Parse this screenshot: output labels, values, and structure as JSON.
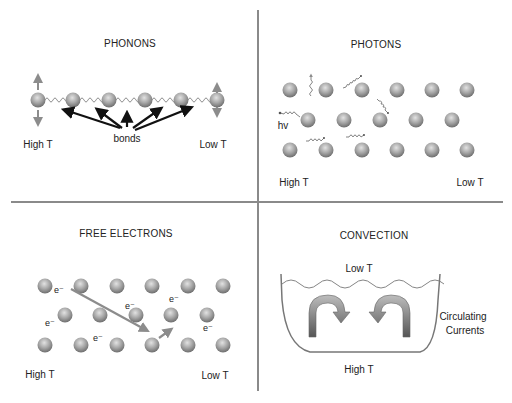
{
  "panels": {
    "phonons": {
      "title": "PHONONS",
      "bonds_label": "bonds",
      "hot_label": "High T",
      "cold_label": "Low T",
      "atoms_x": [
        38,
        73,
        109,
        145,
        181,
        217
      ],
      "atoms_y": 100
    },
    "photons": {
      "title": "PHOTONS",
      "photon_label": "hv",
      "hot_label": "High T",
      "cold_label": "Low T"
    },
    "free_electrons": {
      "title": "FREE ELECTRONS",
      "electron_label": "e⁻",
      "hot_label": "High T",
      "cold_label": "Low T"
    },
    "convection": {
      "title": "CONVECTION",
      "top_label": "Low T",
      "bottom_label": "High T",
      "side_label_line1": "Circulating",
      "side_label_line2": "Currents"
    }
  },
  "colors": {
    "divider": "#8a8a8a",
    "atom_light": "#d4d4d4",
    "atom_dark": "#7d7d7d",
    "arrow_gray": "#8c8c8c",
    "arrow_black": "#111111"
  }
}
